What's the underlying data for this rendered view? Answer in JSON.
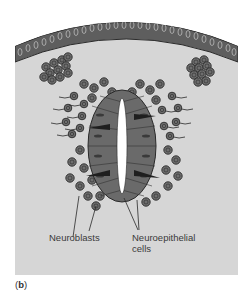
{
  "figure": {
    "panel_label_open": "(",
    "panel_label_letter": "b",
    "panel_label_close": ")",
    "labels": {
      "neuroblasts": "Neuroblasts",
      "neuroepithelial_line1": "Neuroepithelial",
      "neuroepithelial_line2": "cells"
    },
    "colors": {
      "background": "#d6d6d6",
      "page": "#ffffff",
      "cell_fill": "#6e6e6e",
      "cell_outline": "#2e2e2e",
      "lumen": "#ffffff",
      "text": "#3a3a3a"
    }
  }
}
